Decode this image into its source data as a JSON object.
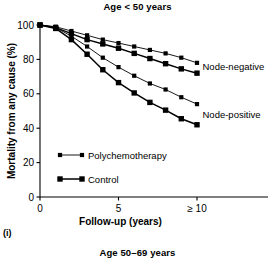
{
  "figure": {
    "panel_label": "(i)",
    "title": "Age < 50 years",
    "next_panel_title": "Age 50–69 years"
  },
  "chart_data": {
    "type": "line",
    "title": "Age < 50 years",
    "xlabel": "Follow-up (years)",
    "ylabel": "Mortality from any cause (%)",
    "xlim": [
      0,
      10
    ],
    "ylim": [
      0,
      100
    ],
    "xticks": [
      0,
      5,
      10
    ],
    "xtick_labels": [
      "0",
      "5",
      "≥ 10"
    ],
    "yticks": [
      0,
      20,
      40,
      60,
      80,
      100
    ],
    "ytick_labels": [
      "0",
      "20",
      "40",
      "60",
      "80",
      "100"
    ],
    "grid": false,
    "legend_position": "inside-lower-left",
    "x": [
      0,
      1,
      2,
      3,
      4,
      5,
      6,
      7,
      8,
      9,
      10
    ],
    "series": [
      {
        "name": "Node-negative, Polychemotherapy",
        "group": "Node-negative",
        "arm": "Polychemotherapy",
        "line_weight": "thin",
        "marker_size": 2.1,
        "values": [
          100,
          99,
          96.5,
          94,
          91.5,
          89.5,
          87.5,
          85.5,
          83.5,
          81,
          78
        ]
      },
      {
        "name": "Node-negative, Control",
        "group": "Node-negative",
        "arm": "Control",
        "line_weight": "thick",
        "marker_size": 2.7,
        "values": [
          100,
          98.5,
          95,
          91.5,
          89,
          86.5,
          83.5,
          80.5,
          77.5,
          74.5,
          72
        ]
      },
      {
        "name": "Node-positive, Polychemotherapy",
        "group": "Node-positive",
        "arm": "Polychemotherapy",
        "line_weight": "thin",
        "marker_size": 2.1,
        "values": [
          100,
          98.5,
          93.5,
          87.5,
          81,
          75.5,
          70.5,
          66,
          62.5,
          58,
          54
        ]
      },
      {
        "name": "Node-positive, Control",
        "group": "Node-positive",
        "arm": "Control",
        "line_weight": "thick",
        "marker_size": 2.7,
        "values": [
          100,
          98,
          91.5,
          83,
          74,
          66.5,
          60.5,
          55,
          50.5,
          45.5,
          42
        ]
      }
    ],
    "annotations": [
      {
        "text": "Node-negative",
        "x": 10.35,
        "y": 76
      },
      {
        "text": "Node-positive",
        "x": 10.35,
        "y": 48
      }
    ],
    "legend": [
      {
        "label": "Polychemotherapy",
        "line_weight": "thin",
        "marker_size": 2.1
      },
      {
        "label": "Control",
        "line_weight": "thick",
        "marker_size": 2.7
      }
    ]
  }
}
